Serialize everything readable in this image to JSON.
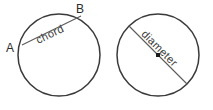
{
  "figure": {
    "background_color": "#ffffff",
    "stroke_color": "#3a3a3a",
    "line_color": "#5a5a5a",
    "text_color": "#2b2b2b"
  },
  "left_circle": {
    "name": "chord-circle",
    "center_x": 59,
    "center_y": 55,
    "radius": 41,
    "segment_label": "chord",
    "endpoint_a_label": "A",
    "endpoint_b_label": "B",
    "chord_x1": 22,
    "chord_y1": 45,
    "chord_x2": 81,
    "chord_y2": 16,
    "label_angle": "-26"
  },
  "right_circle": {
    "name": "diameter-circle",
    "center_x": 158,
    "center_y": 55,
    "radius": 41,
    "segment_label": "diameter",
    "diameter_x1": 129,
    "diameter_y1": 26,
    "diameter_x2": 187,
    "diameter_y2": 84,
    "label_angle": "45",
    "has_center_point": "true"
  }
}
